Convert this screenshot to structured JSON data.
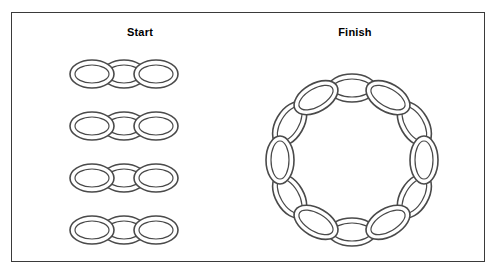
{
  "figure": {
    "background_color": "#ffffff",
    "frame_color": "#3a3a3a",
    "ring_stroke_color": "#4a4a4a"
  },
  "panels": {
    "start": {
      "title": "Start",
      "description": "Four separate horizontal chains, each made of three interlocking oval rings",
      "chain_count": 4,
      "rings_per_chain": 3,
      "total_rings": 12
    },
    "finish": {
      "title": "Finish",
      "description": "One closed circular chain made of twelve interlocking oval rings",
      "chain_count": 1,
      "rings_per_chain": 12,
      "total_rings": 12
    }
  },
  "layout": {
    "start_chains": [
      {
        "y": 74,
        "xs": [
          92,
          124,
          156
        ]
      },
      {
        "y": 126,
        "xs": [
          92,
          124,
          156
        ]
      },
      {
        "y": 178,
        "xs": [
          92,
          124,
          156
        ]
      },
      {
        "y": 230,
        "xs": [
          92,
          124,
          156
        ]
      }
    ],
    "start_ring": {
      "rx": 22,
      "ry": 14,
      "inner_rx": 17,
      "inner_ry": 9
    },
    "finish_circle": {
      "cx": 352,
      "cy": 160,
      "radius": 72,
      "ring_count": 12
    },
    "finish_ring": {
      "rx": 24,
      "ry": 14,
      "inner_rx": 19,
      "inner_ry": 9
    }
  }
}
